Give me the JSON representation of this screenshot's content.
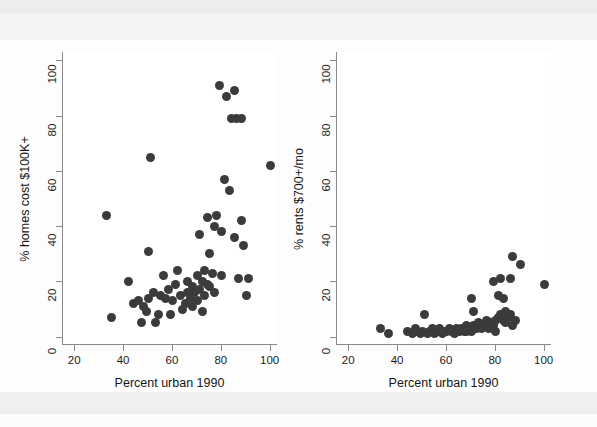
{
  "figure": {
    "background": "#fdfdfd",
    "marker_color": "#3b3b3b",
    "axis_color": "#8a8a8a"
  },
  "chart_data": [
    {
      "type": "scatter",
      "panel": "left",
      "title": "",
      "xlabel": "Percent urban 1990",
      "ylabel": "% homes cost $100K+",
      "xlim": [
        15,
        103
      ],
      "ylim": [
        -3,
        103
      ],
      "xticks": [
        20,
        40,
        60,
        80,
        100
      ],
      "yticks": [
        0,
        20,
        40,
        60,
        80,
        100
      ],
      "grid": false,
      "legend": null,
      "points": [
        {
          "x": 33,
          "y": 44
        },
        {
          "x": 35,
          "y": 7
        },
        {
          "x": 42,
          "y": 20
        },
        {
          "x": 44,
          "y": 12
        },
        {
          "x": 46,
          "y": 13
        },
        {
          "x": 47,
          "y": 5
        },
        {
          "x": 48,
          "y": 11
        },
        {
          "x": 49,
          "y": 9
        },
        {
          "x": 50,
          "y": 31
        },
        {
          "x": 50,
          "y": 14
        },
        {
          "x": 51,
          "y": 65
        },
        {
          "x": 52,
          "y": 16
        },
        {
          "x": 53,
          "y": 5
        },
        {
          "x": 54,
          "y": 8
        },
        {
          "x": 55,
          "y": 15
        },
        {
          "x": 56,
          "y": 22
        },
        {
          "x": 57,
          "y": 14
        },
        {
          "x": 58,
          "y": 17
        },
        {
          "x": 59,
          "y": 8
        },
        {
          "x": 60,
          "y": 13
        },
        {
          "x": 61,
          "y": 19
        },
        {
          "x": 62,
          "y": 24
        },
        {
          "x": 63,
          "y": 15
        },
        {
          "x": 64,
          "y": 10
        },
        {
          "x": 65,
          "y": 12
        },
        {
          "x": 66,
          "y": 16
        },
        {
          "x": 66,
          "y": 20
        },
        {
          "x": 67,
          "y": 14
        },
        {
          "x": 68,
          "y": 18
        },
        {
          "x": 68,
          "y": 11
        },
        {
          "x": 69,
          "y": 16
        },
        {
          "x": 70,
          "y": 22
        },
        {
          "x": 70,
          "y": 13
        },
        {
          "x": 71,
          "y": 17
        },
        {
          "x": 71,
          "y": 37
        },
        {
          "x": 72,
          "y": 20
        },
        {
          "x": 72,
          "y": 9
        },
        {
          "x": 73,
          "y": 15
        },
        {
          "x": 73,
          "y": 24
        },
        {
          "x": 74,
          "y": 19
        },
        {
          "x": 74,
          "y": 43
        },
        {
          "x": 75,
          "y": 30
        },
        {
          "x": 75,
          "y": 18
        },
        {
          "x": 76,
          "y": 23
        },
        {
          "x": 77,
          "y": 40
        },
        {
          "x": 77,
          "y": 16
        },
        {
          "x": 78,
          "y": 44
        },
        {
          "x": 79,
          "y": 91
        },
        {
          "x": 80,
          "y": 38
        },
        {
          "x": 80,
          "y": 22
        },
        {
          "x": 81,
          "y": 57
        },
        {
          "x": 82,
          "y": 87
        },
        {
          "x": 83,
          "y": 53
        },
        {
          "x": 84,
          "y": 79
        },
        {
          "x": 85,
          "y": 89
        },
        {
          "x": 85,
          "y": 36
        },
        {
          "x": 86,
          "y": 79
        },
        {
          "x": 87,
          "y": 21
        },
        {
          "x": 88,
          "y": 42
        },
        {
          "x": 88,
          "y": 79
        },
        {
          "x": 89,
          "y": 33
        },
        {
          "x": 90,
          "y": 15
        },
        {
          "x": 91,
          "y": 21
        },
        {
          "x": 100,
          "y": 62
        }
      ]
    },
    {
      "type": "scatter",
      "panel": "right",
      "title": "",
      "xlabel": "Percent urban 1990",
      "ylabel": "% rents $700+/mo",
      "xlim": [
        15,
        103
      ],
      "ylim": [
        -3,
        103
      ],
      "xticks": [
        20,
        40,
        60,
        80,
        100
      ],
      "yticks": [
        0,
        20,
        40,
        60,
        80,
        100
      ],
      "grid": false,
      "legend": null,
      "points": [
        {
          "x": 33,
          "y": 3
        },
        {
          "x": 36,
          "y": 1
        },
        {
          "x": 44,
          "y": 2
        },
        {
          "x": 46,
          "y": 1
        },
        {
          "x": 47,
          "y": 3
        },
        {
          "x": 48,
          "y": 2
        },
        {
          "x": 49,
          "y": 1
        },
        {
          "x": 50,
          "y": 2
        },
        {
          "x": 51,
          "y": 8
        },
        {
          "x": 52,
          "y": 1
        },
        {
          "x": 53,
          "y": 2
        },
        {
          "x": 54,
          "y": 3
        },
        {
          "x": 55,
          "y": 1
        },
        {
          "x": 56,
          "y": 2
        },
        {
          "x": 57,
          "y": 3
        },
        {
          "x": 58,
          "y": 1
        },
        {
          "x": 59,
          "y": 2
        },
        {
          "x": 60,
          "y": 2
        },
        {
          "x": 61,
          "y": 3
        },
        {
          "x": 62,
          "y": 2
        },
        {
          "x": 63,
          "y": 1
        },
        {
          "x": 64,
          "y": 3
        },
        {
          "x": 65,
          "y": 2
        },
        {
          "x": 66,
          "y": 3
        },
        {
          "x": 67,
          "y": 2
        },
        {
          "x": 68,
          "y": 4
        },
        {
          "x": 68,
          "y": 2
        },
        {
          "x": 69,
          "y": 3
        },
        {
          "x": 70,
          "y": 14
        },
        {
          "x": 70,
          "y": 2
        },
        {
          "x": 71,
          "y": 4
        },
        {
          "x": 71,
          "y": 9
        },
        {
          "x": 72,
          "y": 3
        },
        {
          "x": 73,
          "y": 5
        },
        {
          "x": 74,
          "y": 3
        },
        {
          "x": 75,
          "y": 4
        },
        {
          "x": 76,
          "y": 6
        },
        {
          "x": 77,
          "y": 3
        },
        {
          "x": 78,
          "y": 5
        },
        {
          "x": 79,
          "y": 20
        },
        {
          "x": 79,
          "y": 4
        },
        {
          "x": 80,
          "y": 2
        },
        {
          "x": 80,
          "y": 6
        },
        {
          "x": 81,
          "y": 7
        },
        {
          "x": 81,
          "y": 15
        },
        {
          "x": 82,
          "y": 21
        },
        {
          "x": 82,
          "y": 8
        },
        {
          "x": 83,
          "y": 6
        },
        {
          "x": 83,
          "y": 14
        },
        {
          "x": 84,
          "y": 9
        },
        {
          "x": 84,
          "y": 5
        },
        {
          "x": 85,
          "y": 7
        },
        {
          "x": 86,
          "y": 21
        },
        {
          "x": 86,
          "y": 8
        },
        {
          "x": 87,
          "y": 29
        },
        {
          "x": 87,
          "y": 4
        },
        {
          "x": 88,
          "y": 6
        },
        {
          "x": 90,
          "y": 26
        },
        {
          "x": 100,
          "y": 19
        }
      ]
    }
  ]
}
